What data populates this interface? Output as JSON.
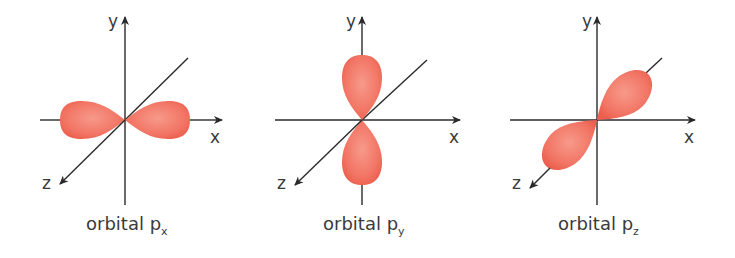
{
  "diagram": {
    "panels": [
      {
        "id": "px",
        "caption_prefix": "orbital p",
        "caption_sub": "x",
        "axis_labels": {
          "x": "x",
          "y": "y",
          "z": "z"
        }
      },
      {
        "id": "py",
        "caption_prefix": "orbital p",
        "caption_sub": "y",
        "axis_labels": {
          "x": "x",
          "y": "y",
          "z": "z"
        }
      },
      {
        "id": "pz",
        "caption_prefix": "orbital p",
        "caption_sub": "z",
        "axis_labels": {
          "x": "x",
          "y": "y",
          "z": "z"
        }
      }
    ],
    "colors": {
      "lobe": "#f26a5a",
      "lobe_light": "#f7a090",
      "axis": "#2a2a2a"
    }
  }
}
